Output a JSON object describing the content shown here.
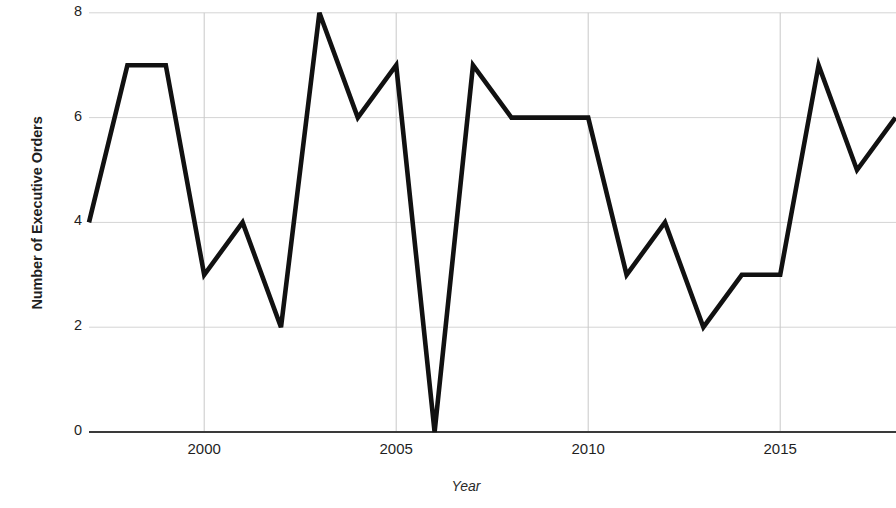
{
  "chart_data": {
    "type": "line",
    "title": "",
    "xlabel": "Year",
    "ylabel": "Number of Executive Orders",
    "x": [
      1997,
      1998,
      1999,
      2000,
      2001,
      2002,
      2003,
      2004,
      2005,
      2006,
      2007,
      2008,
      2009,
      2010,
      2011,
      2012,
      2013,
      2014,
      2015,
      2016,
      2017,
      2018
    ],
    "values": [
      4,
      7,
      7,
      3,
      4,
      2,
      8,
      6,
      7,
      0,
      7,
      6,
      6,
      6,
      3,
      4,
      2,
      3,
      3,
      7,
      5,
      6
    ],
    "series": [
      {
        "name": "Number of Executive Orders",
        "values": [
          4,
          7,
          7,
          3,
          4,
          2,
          8,
          6,
          7,
          0,
          7,
          6,
          6,
          6,
          3,
          4,
          2,
          3,
          3,
          7,
          5,
          6
        ]
      }
    ],
    "xlim": [
      1997,
      2018
    ],
    "ylim": [
      0,
      8
    ],
    "y_ticks": [
      0,
      2,
      4,
      6,
      8
    ],
    "y_tick_labels": [
      "0",
      "2",
      "4",
      "6",
      "8"
    ],
    "x_ticks": [
      2000,
      2005,
      2010,
      2015
    ],
    "x_tick_labels": [
      "2000",
      "2005",
      "2010",
      "2015"
    ],
    "grid": true,
    "grid_axis": "both",
    "legend": false,
    "legend_position": "none",
    "line_color": "#111111",
    "grid_color": "#d4d4d4",
    "axis_color": "#3a3a3a",
    "background_color": "#ffffff"
  },
  "axes": {
    "y_label": "Number of Executive Orders",
    "x_label": "Year"
  }
}
